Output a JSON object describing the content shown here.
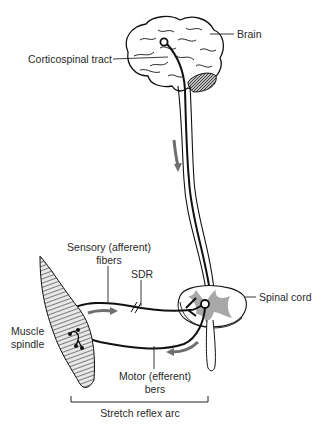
{
  "diagram": {
    "title": "Stretch reflex arc",
    "labels": {
      "brain": "Brain",
      "corticospinal_tract": "Corticospinal tract",
      "sensory_fibers_line1": "Sensory (afferent)",
      "sensory_fibers_line2": "fibers",
      "sdr": "SDR",
      "spinal_cord": "Spinal cord",
      "muscle_spindle_line1": "Muscle",
      "muscle_spindle_line2": "spindle",
      "motor_fibers_line1": "Motor (efferent)",
      "motor_fibers_line2": "bers",
      "stretch_reflex_arc": "Stretch reflex arc"
    },
    "colors": {
      "line": "#111111",
      "gray_matter": "#a8a8a8",
      "arrow": "#6f6f6f",
      "text": "#2a2a2a"
    }
  }
}
